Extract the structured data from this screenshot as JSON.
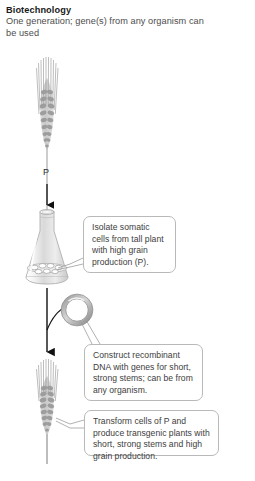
{
  "header": {
    "title": "Biotechnology",
    "subtitle": "One generation; gene(s) from any organism can be used"
  },
  "labels": {
    "parent_plant": "P"
  },
  "callouts": [
    {
      "id": "isolate-cells",
      "text": "Isolate somatic cells from tall plant with high grain production (P)."
    },
    {
      "id": "construct-dna",
      "text": "Construct recombinant DNA with genes for short, strong stems; can be from any organism."
    },
    {
      "id": "transform-cells",
      "text": "Transform cells of P and produce transgenic plants with short, strong stems and high grain production."
    }
  ],
  "figure": {
    "tall_plant_name": "tall-wheat-plant",
    "flask_name": "erlenmeyer-flask-with-cells",
    "plasmid_name": "recombinant-dna-plasmid",
    "short_plant_name": "short-transgenic-wheat-plant"
  },
  "colors": {
    "text": "#3d3d3d",
    "title": "#1a1a1a",
    "outline": "#b9b9b9",
    "arrow": "#1a1a1a",
    "plant_light": "#cfcfcf",
    "plant_dark": "#8e8e8e",
    "glass": "#d8d8d8"
  }
}
